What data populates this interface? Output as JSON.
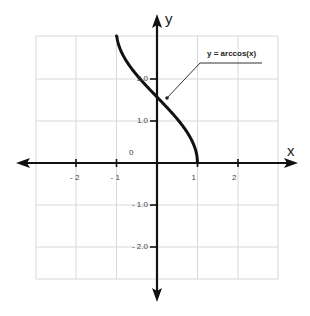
{
  "chart_data": {
    "type": "line",
    "title": "",
    "xlabel": "x",
    "ylabel": "y",
    "xlim": [
      -3,
      3
    ],
    "ylim": [
      -3,
      3
    ],
    "grid": true,
    "x_ticks": [
      {
        "value": -2,
        "label": "- 2"
      },
      {
        "value": -1,
        "label": "- 1"
      },
      {
        "value": 1,
        "label": "1"
      },
      {
        "value": 2,
        "label": "2"
      }
    ],
    "y_ticks": [
      {
        "value": 2.0,
        "label": "2.0"
      },
      {
        "value": 1.0,
        "label": "1.0"
      },
      {
        "value": -1.0,
        "label": "- 1.0"
      },
      {
        "value": -2.0,
        "label": "- 2.0"
      }
    ],
    "origin_label": "0",
    "series": [
      {
        "name": "y = arccos(x)",
        "function": "arccos(x)",
        "x": [
          -1,
          -0.75,
          -0.5,
          -0.25,
          0,
          0.25,
          0.5,
          0.75,
          1
        ],
        "y": [
          3.14,
          2.42,
          2.09,
          1.82,
          1.57,
          1.32,
          1.05,
          0.72,
          0
        ],
        "color": "#111111"
      }
    ],
    "annotations": [
      {
        "text": "y = arccos(x)",
        "points_to": [
          0.25,
          1.57
        ]
      }
    ]
  }
}
